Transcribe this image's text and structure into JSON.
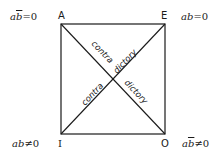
{
  "diagram": {
    "corners": {
      "A": {
        "label": "A",
        "formula_pre": "a",
        "formula_barred": "b",
        "formula_post": "=0"
      },
      "E": {
        "label": "E",
        "formula_pre": "ab",
        "formula_barred": "",
        "formula_post": "=0"
      },
      "I": {
        "label": "I",
        "formula_pre": "ab",
        "formula_barred": "",
        "formula_post": "≠0"
      },
      "O": {
        "label": "O",
        "formula_pre": "a",
        "formula_barred": "b",
        "formula_post": "≠0"
      }
    },
    "diagonals": {
      "AO": {
        "left_text": "contra",
        "right_text": "dictory"
      },
      "IE": {
        "left_text": "contra",
        "right_text": "dictory"
      }
    },
    "colors": {
      "line": "#1a1a1a",
      "background": "#ffffff"
    }
  }
}
